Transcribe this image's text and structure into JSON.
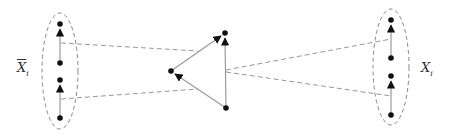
{
  "diagram": {
    "type": "graph-mapping",
    "colors": {
      "node": "#111111",
      "edge": "#9a9a9a",
      "dashed": "#999999",
      "ellipse": "#888888"
    },
    "left_group": {
      "label_main": "X",
      "label_sub": "i",
      "label_has_bar": true,
      "nodes": [
        {
          "id": "L1",
          "x": 60,
          "y": 24
        },
        {
          "id": "L2",
          "x": 60,
          "y": 63
        },
        {
          "id": "L3",
          "x": 60,
          "y": 80
        },
        {
          "id": "L4",
          "x": 60,
          "y": 118
        }
      ],
      "edges": [
        {
          "from": "L2",
          "to": "L1",
          "directed": true
        },
        {
          "from": "L4",
          "to": "L3",
          "directed": true
        }
      ]
    },
    "center_graph": {
      "nodes": [
        {
          "id": "T",
          "x": 225,
          "y": 33
        },
        {
          "id": "M",
          "x": 171,
          "y": 71
        },
        {
          "id": "B",
          "x": 226,
          "y": 108
        }
      ],
      "edges": [
        {
          "from": "M",
          "to": "T",
          "directed": true
        },
        {
          "from": "B",
          "to": "T",
          "directed": true
        },
        {
          "from": "B",
          "to": "M",
          "directed": true
        }
      ]
    },
    "right_group": {
      "label_main": "X",
      "label_sub": "i",
      "label_has_bar": false,
      "nodes": [
        {
          "id": "R1",
          "x": 391,
          "y": 20
        },
        {
          "id": "R2",
          "x": 391,
          "y": 58
        },
        {
          "id": "R3",
          "x": 391,
          "y": 76
        },
        {
          "id": "R4",
          "x": 391,
          "y": 115
        }
      ],
      "edges": [
        {
          "from": "R2",
          "to": "R1",
          "directed": true
        },
        {
          "from": "R4",
          "to": "R3",
          "directed": true
        }
      ]
    },
    "mappings": [
      {
        "from": "left edge L2-L1",
        "to": "center edge M-T",
        "style": "dashed"
      },
      {
        "from": "left edge L4-L3",
        "to": "center edge B-M",
        "style": "dashed"
      },
      {
        "from": "center edge B-T",
        "to": "right edge R2-R1",
        "style": "dashed"
      },
      {
        "from": "center edge B-T",
        "to": "right edge R4-R3",
        "style": "dashed"
      }
    ]
  }
}
